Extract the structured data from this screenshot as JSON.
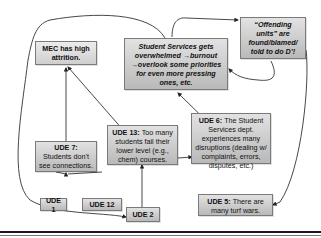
{
  "diagram": {
    "type": "current-reality-tree",
    "nodes": {
      "mec": {
        "text": "MEC has high attrition."
      },
      "student_services": {
        "text": "Student Services gets overwhelmed →burnout →overlook some priorities for even more pressing ones, etc."
      },
      "offending_units": {
        "text": "“Offending units” are found/blamed/ told to do D’!"
      },
      "ude7": {
        "label": "UDE 7:",
        "text": "Students don’t see connections."
      },
      "ude13": {
        "label": "UDE 13:",
        "text": " Too many students fail their lower level (e.g., chem) courses."
      },
      "ude6": {
        "label": "UDE 6:",
        "text": " The Student Services dept. experiences many disruptions (dealing w/ complaints, errors, disputes, etc.)"
      },
      "ude5": {
        "label": "UDE 5:",
        "text": " There are many turf wars."
      },
      "ude1": {
        "label": "UDE 1"
      },
      "ude12": {
        "label": "UDE 12"
      },
      "ude2": {
        "label": "UDE 2"
      }
    },
    "edges": [
      {
        "from": "UDE 1",
        "to": "UDE 7"
      },
      {
        "from": "UDE 12",
        "to": "UDE 7"
      },
      {
        "from": "UDE 7",
        "to": "MEC has high attrition."
      },
      {
        "from": "UDE 13",
        "to": "MEC has high attrition."
      },
      {
        "from": "UDE 2",
        "to": "UDE 13"
      },
      {
        "from": "UDE 13",
        "to": "UDE 6"
      },
      {
        "from": "UDE 6",
        "to": "Student Services gets overwhelmed"
      },
      {
        "from": "Student Services gets overwhelmed",
        "to": "Offending units are found/blamed"
      },
      {
        "from": "Offending units are found/blamed",
        "to": "Student Services gets overwhelmed"
      },
      {
        "from": "Offending units are found/blamed",
        "to": "UDE 5"
      },
      {
        "from": "Student Services gets overwhelmed",
        "to": "UDE 2"
      }
    ],
    "colors": {
      "box_fill_top": "#e2e2e2",
      "box_fill_bottom": "#b9b9b9",
      "box_border": "#7a7a7a",
      "line": "#333333",
      "rule": "#1a1a1a"
    }
  }
}
